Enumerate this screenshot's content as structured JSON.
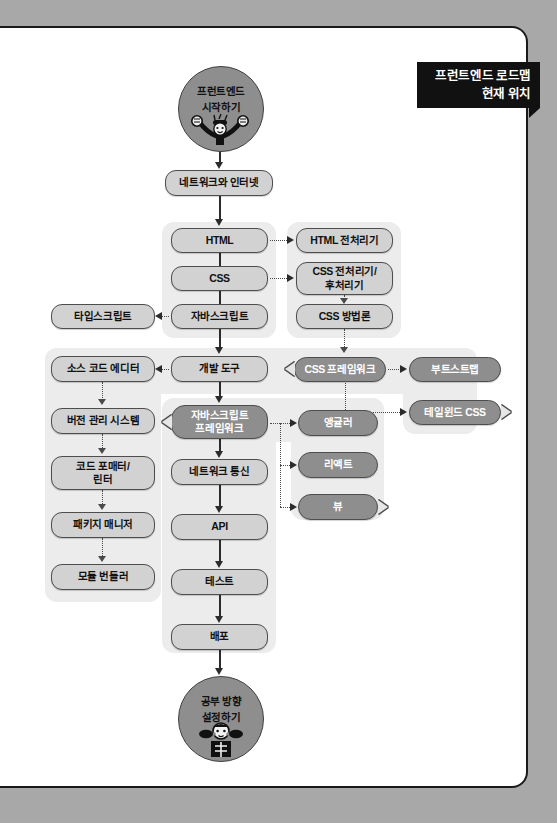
{
  "page": {
    "background_color": "#a8a8a8",
    "paper_color": "#ffffff"
  },
  "banner": {
    "name": "frontend-roadmap-banner",
    "line1": "프런트엔드 로드맵",
    "line2": "현재 위치",
    "background_color": "#111111",
    "text_color": "#ffffff"
  },
  "colors": {
    "node_fill": "#d2d2d2",
    "node_highlight_fill": "#8e8e8e",
    "node_border": "#4d4d4d",
    "group_fill": "#ececec",
    "connector": "#2b2b2b"
  },
  "start_node": {
    "line1": "프런트엔드",
    "line2": "시작하기"
  },
  "end_node": {
    "line1": "공부 방향",
    "line2": "설정하기"
  },
  "nodes": {
    "network_internet": "네트워크와 인터넷",
    "html": "HTML",
    "css": "CSS",
    "javascript": "자바스크립트",
    "html_preprocessor": "HTML 전처리기",
    "css_pre_post": "CSS 전처리기/\n후처리기",
    "css_pre_post_l1": "CSS 전처리기/",
    "css_pre_post_l2": "후처리기",
    "css_methodology": "CSS 방법론",
    "typescript": "타입스크립트",
    "source_code_editor": "소스 코드 에디터",
    "dev_tools": "개발 도구",
    "css_framework": "CSS 프레임워크",
    "bootstrap": "부트스트랩",
    "tailwind_css": "테일윈드 CSS",
    "version_control": "버전 관리 시스템",
    "js_framework_l1": "자바스크립트",
    "js_framework_l2": "프레임워크",
    "angular": "앵귤러",
    "react": "리액트",
    "vue": "뷰",
    "code_formatter_l1": "코드 포매터/",
    "code_formatter_l2": "린터",
    "network_comm": "네트워크 통신",
    "package_manager": "패키지 매니저",
    "api": "API",
    "module_bundler": "모듈 번들러",
    "test": "테스트",
    "deploy": "배포"
  }
}
